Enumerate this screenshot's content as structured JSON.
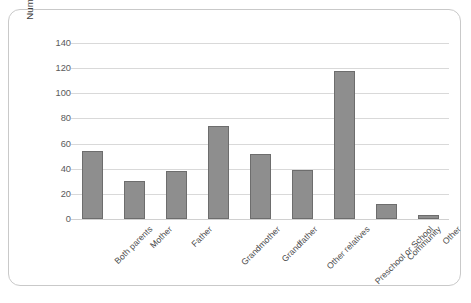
{
  "chart_data": {
    "type": "bar",
    "title": "",
    "subtitle": "",
    "xlabel": "",
    "ylabel": "Number of respondents",
    "categories": [
      "Both parents",
      "Mother",
      "Father",
      "Grandmother",
      "Grandfather",
      "Other relatives",
      "Preschool or School",
      "Community",
      "Other"
    ],
    "values": [
      54,
      30,
      38,
      74,
      52,
      39,
      118,
      12,
      3
    ],
    "ylim": [
      0,
      140
    ],
    "yticks": [
      0,
      20,
      40,
      60,
      80,
      100,
      120,
      140
    ],
    "ytick_labels": [
      "0",
      "20",
      "40",
      "60",
      "80",
      "100",
      "120",
      "140"
    ],
    "grid": true,
    "grid_axis": "y",
    "legend": false,
    "legend_position": "none",
    "bar_color": "#8e8e8e",
    "bar_border_color": "#6d6d6d",
    "gridline_color": "#d9d9d9",
    "axis_text_color": "#5a5a5a",
    "frame_border_color": "#c9c9c9",
    "background_color": "#ffffff",
    "xtick_label_rotation": -45
  }
}
